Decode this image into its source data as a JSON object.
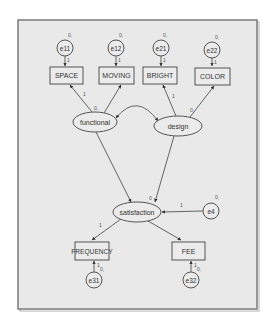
{
  "diagram": {
    "type": "structural-equation-model",
    "colors": {
      "frame_fill": "#e9e9e9",
      "frame_border": "#7a7a7a",
      "node_fill": "#ebebeb",
      "stroke": "#555555",
      "text": "#333333"
    },
    "observed": {
      "space": "SPACE",
      "moving": "MOVING",
      "bright": "BRIGHT",
      "color": "COLOR",
      "frequency": "FREQUENCY",
      "fee": "FEE"
    },
    "latent": {
      "functional": "functional",
      "design": "design",
      "satisfaction": "satisfaction"
    },
    "errors": {
      "e11": "e11",
      "e12": "e12",
      "e21": "e21",
      "e22": "e22",
      "e31": "e31",
      "e32": "e32",
      "e4": "e4"
    },
    "params": {
      "e11_mean": "0,",
      "e11_weight": "1",
      "e12_mean": "0,",
      "e12_weight": "1",
      "e21_mean": "0,",
      "e21_weight": "1",
      "e22_mean": "0,",
      "e22_weight": "1",
      "functional_var": "0,",
      "functional_space_weight": "1",
      "design_var": "0,",
      "design_bright_weight": "1",
      "satisfaction_intercept": "0",
      "e4_mean": "0,",
      "e4_weight": "1",
      "satisfaction_frequency_weight": "1",
      "e31_mean": "0,",
      "e31_weight": "1",
      "e32_mean": "0,",
      "e32_weight": "1"
    },
    "edges": [
      {
        "from": "e11",
        "to": "SPACE"
      },
      {
        "from": "e12",
        "to": "MOVING"
      },
      {
        "from": "e21",
        "to": "BRIGHT"
      },
      {
        "from": "e22",
        "to": "COLOR"
      },
      {
        "from": "functional",
        "to": "SPACE"
      },
      {
        "from": "functional",
        "to": "MOVING"
      },
      {
        "from": "design",
        "to": "BRIGHT"
      },
      {
        "from": "design",
        "to": "COLOR"
      },
      {
        "from": "functional",
        "to": "design",
        "kind": "covariance"
      },
      {
        "from": "functional",
        "to": "satisfaction"
      },
      {
        "from": "design",
        "to": "satisfaction"
      },
      {
        "from": "e4",
        "to": "satisfaction"
      },
      {
        "from": "satisfaction",
        "to": "FREQUENCY"
      },
      {
        "from": "satisfaction",
        "to": "FEE"
      },
      {
        "from": "e31",
        "to": "FREQUENCY"
      },
      {
        "from": "e32",
        "to": "FEE"
      }
    ]
  }
}
